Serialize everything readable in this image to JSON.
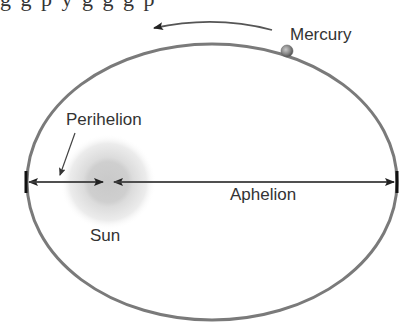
{
  "top_clipped_text": "g g p                                   y  g g g p",
  "diagram": {
    "labels": {
      "planet": "Mercury",
      "star": "Sun",
      "perihelion": "Perihelion",
      "aphelion": "Aphelion"
    },
    "colors": {
      "orbit": "#777777",
      "arrows": "#333333",
      "label_text": "#333333",
      "sun_outer": "#e6e6e6",
      "sun_core": "#cfcfcf",
      "planet": "#888888"
    },
    "orbit": {
      "cx": 212,
      "cy": 182,
      "rx": 185,
      "ry": 138
    },
    "sun": {
      "cx": 108,
      "cy": 182,
      "outer_r": 46,
      "core_r": 22
    },
    "planet_position": {
      "cx": 287,
      "cy": 51,
      "r": 6
    },
    "motion_direction": "counterclockwise"
  }
}
